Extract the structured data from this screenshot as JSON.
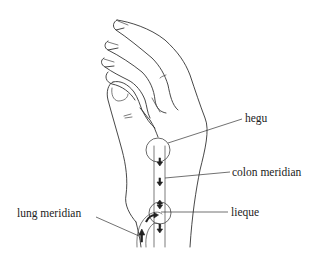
{
  "figure": {
    "labels": {
      "hegu": "hegu",
      "colon_meridian": "colon meridian",
      "lieque": "lieque",
      "lung_meridian": "lung meridian"
    },
    "acupoints": [
      {
        "name": "hegu",
        "marker": "circle"
      },
      {
        "name": "lieque",
        "marker": "circle"
      }
    ],
    "meridians": [
      {
        "name": "colon meridian",
        "flow": "down"
      },
      {
        "name": "lung meridian",
        "flow": "up, curving into colon meridian"
      }
    ]
  }
}
